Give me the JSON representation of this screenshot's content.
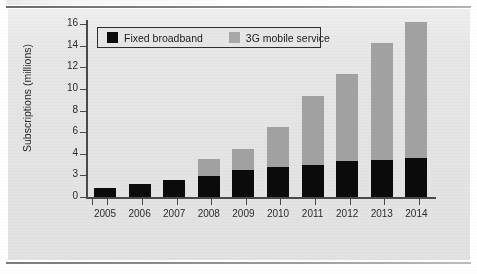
{
  "figure": {
    "background_color": "#e6e6e6",
    "page_color": "#ffffff",
    "rule_color": "#6d6d6d"
  },
  "legend": {
    "position": "top-left-inside",
    "entries": [
      {
        "label": "Fixed broadband",
        "color": "#0b0b0b",
        "swatch": "square-swatch"
      },
      {
        "label": "3G mobile service",
        "color": "#a2a2a2",
        "swatch": "square-swatch"
      }
    ]
  },
  "axes": {
    "y_title": "Subscriptions (millions)",
    "y_ticks": [
      "0",
      "3",
      "4",
      "6",
      "8",
      "10",
      "12",
      "14",
      "16"
    ],
    "x_ticks": [
      "2005",
      "2006",
      "2007",
      "2008",
      "2009",
      "2010",
      "2011",
      "2012",
      "2013",
      "2014"
    ]
  },
  "chart_data": {
    "type": "bar",
    "subtype": "stacked-vertical",
    "title": "",
    "subtitle": "",
    "xlabel": "",
    "ylabel": "Subscriptions (millions)",
    "categories": [
      "2005",
      "2006",
      "2007",
      "2008",
      "2009",
      "2010",
      "2011",
      "2012",
      "2013",
      "2014"
    ],
    "series": [
      {
        "name": "Fixed broadband",
        "color": "#0b0b0b",
        "values": [
          0.8,
          1.2,
          1.6,
          1.9,
          2.5,
          2.8,
          3.0,
          3.3,
          3.4,
          3.6
        ]
      },
      {
        "name": "3G mobile service",
        "color": "#a2a2a2",
        "values": [
          0.0,
          0.0,
          0.0,
          1.6,
          1.9,
          3.7,
          6.3,
          8.1,
          10.8,
          12.6
        ]
      }
    ],
    "totals": [
      0.8,
      1.2,
      1.6,
      3.5,
      4.4,
      6.5,
      9.3,
      11.4,
      14.2,
      16.2
    ],
    "ylim": [
      0,
      17
    ],
    "y_tick_values": [
      0,
      2,
      4,
      6,
      8,
      10,
      12,
      14,
      16
    ],
    "y_tick_labels": [
      "0",
      "3",
      "4",
      "6",
      "8",
      "10",
      "12",
      "14",
      "16"
    ],
    "grid": false,
    "legend_position": "upper left"
  }
}
